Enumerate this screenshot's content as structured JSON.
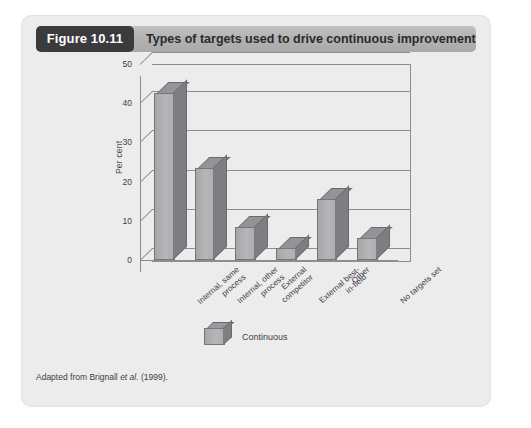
{
  "figure": {
    "badge": "Figure 10.11",
    "title": "Types of targets used to drive continuous improvement",
    "source_prefix": "Adapted from Brignall",
    "source_italic": "et al.",
    "source_suffix": "(1999)."
  },
  "legend": {
    "items": [
      {
        "label": "Continuous",
        "icon": "cube-icon",
        "color": "#b0b0b2"
      }
    ]
  },
  "colors": {
    "panel_background": "#ececed",
    "header_bar": "#b3b3b4",
    "badge_background": "#3b3b3d",
    "badge_text": "#ffffff",
    "bar_front": "#b0b0b2",
    "bar_side": "#7e7e82",
    "bar_top": "#949498",
    "axis_line": "#8d8d8f",
    "text": "#3d3d3f"
  },
  "chart_data": {
    "type": "bar",
    "title": "Types of targets used to drive continuous improvement",
    "xlabel": "",
    "ylabel": "Per cent",
    "ylim": [
      0,
      50
    ],
    "yticks": [
      0,
      10,
      20,
      30,
      40,
      50
    ],
    "grid": true,
    "legend_position": "bottom-center",
    "three_d": true,
    "categories": [
      "Internal, same process",
      "Internal, other process",
      "External competitor",
      "External best-in-field",
      "Other",
      "No targets set"
    ],
    "category_lines": [
      [
        "Internal, same",
        "process"
      ],
      [
        "Internal, other",
        "process"
      ],
      [
        "External",
        "competitor"
      ],
      [
        "External best-",
        "in-field"
      ],
      [
        "Other"
      ],
      [
        "No targets set"
      ]
    ],
    "series": [
      {
        "name": "Continuous",
        "values": [
          42,
          23,
          8,
          2.5,
          15,
          5
        ]
      }
    ]
  }
}
